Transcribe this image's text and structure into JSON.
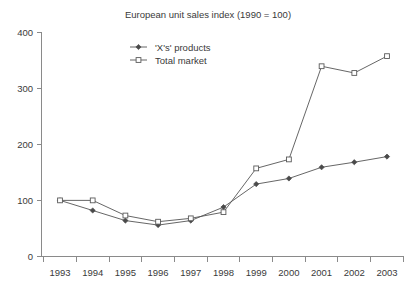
{
  "chart_data": {
    "type": "line",
    "title": "European unit sales index (1990 = 100)",
    "xlabel": "",
    "ylabel": "",
    "categories": [
      "1993",
      "1994",
      "1995",
      "1996",
      "1997",
      "1998",
      "1999",
      "2000",
      "2001",
      "2002",
      "2003"
    ],
    "series": [
      {
        "name": "'X's' products",
        "marker": "filled-diamond",
        "values": [
          100,
          82,
          64,
          56,
          64,
          88,
          129,
          139,
          159,
          168,
          178
        ]
      },
      {
        "name": "Total market",
        "marker": "open-square",
        "values": [
          100,
          100,
          73,
          62,
          68,
          79,
          157,
          173,
          339,
          327,
          357
        ]
      }
    ],
    "ylim": [
      0,
      400
    ],
    "yticks": [
      0,
      100,
      200,
      300,
      400
    ],
    "ytick_labels": [
      "0",
      "100",
      "200",
      "300",
      "400"
    ],
    "grid": false,
    "legend_position": "top-center-inside",
    "colors": {
      "axis": "#8a8a8a",
      "line": "#555555",
      "text": "#3a3a3a",
      "background": "#ffffff"
    }
  },
  "legend": {
    "items": [
      {
        "label": "'X's' products"
      },
      {
        "label": "Total market"
      }
    ]
  }
}
